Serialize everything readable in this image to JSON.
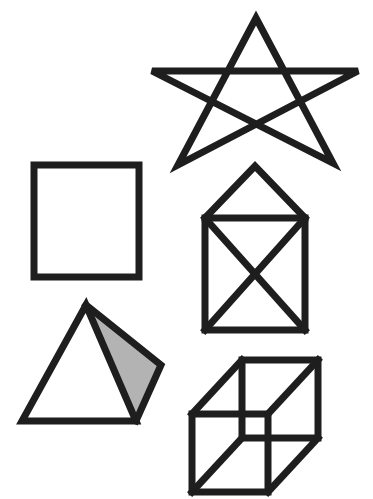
{
  "figure": {
    "background": "#ffffff",
    "stroke_color": "#1e1e1e",
    "shaded_face_color": "#b3b3b3",
    "shapes": [
      {
        "name": "star",
        "points": [
          [
            256,
            18
          ],
          [
            333,
            163
          ],
          [
            152,
            71
          ],
          [
            358,
            71
          ],
          [
            178,
            165
          ]
        ]
      },
      {
        "name": "square",
        "x": 34,
        "y": 165,
        "width": 105,
        "height": 112
      },
      {
        "name": "house",
        "apex": [
          255,
          166
        ],
        "left": 205,
        "right": 305,
        "eave_y": 218,
        "bottom_y": 330
      },
      {
        "name": "pyramid",
        "apex": [
          86,
          305
        ],
        "bottom_left": [
          22,
          421
        ],
        "bottom_right": [
          136,
          421
        ],
        "right": [
          161,
          365
        ]
      },
      {
        "name": "cube",
        "front": [
          192,
          414,
          76,
          78
        ],
        "back": [
          242,
          360,
          76,
          78
        ]
      }
    ]
  }
}
